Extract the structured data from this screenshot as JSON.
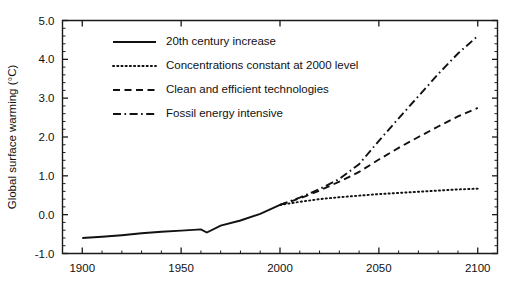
{
  "chart_data": {
    "type": "line",
    "title": "",
    "xlabel": "",
    "ylabel": "Global surface warming (°C)",
    "xlim": [
      1890,
      2110
    ],
    "ylim": [
      -1.0,
      5.0
    ],
    "grid": false,
    "legend_position": "upper-left-inside",
    "x_ticks": [
      1900,
      1950,
      2000,
      2050,
      2100
    ],
    "x_tick_labels": [
      "1900",
      "1950",
      "2000",
      "2050",
      "2100"
    ],
    "x_minor_step": 10,
    "y_ticks": [
      -1.0,
      0.0,
      1.0,
      2.0,
      3.0,
      4.0,
      5.0
    ],
    "y_tick_labels": [
      "-1.0",
      "0.0",
      "1.0",
      "2.0",
      "3.0",
      "4.0",
      "5.0"
    ],
    "y_minor_step": 0.2,
    "series": [
      {
        "name": "20th century increase",
        "style": "solid",
        "x": [
          1900,
          1910,
          1920,
          1930,
          1940,
          1950,
          1960,
          1963,
          1970,
          1980,
          1990,
          2000
        ],
        "y": [
          -0.6,
          -0.57,
          -0.53,
          -0.48,
          -0.44,
          -0.41,
          -0.38,
          -0.46,
          -0.28,
          -0.15,
          0.02,
          0.25
        ]
      },
      {
        "name": "Concentrations constant at 2000 level",
        "style": "dotted",
        "x": [
          2000,
          2010,
          2020,
          2030,
          2040,
          2050,
          2060,
          2070,
          2080,
          2090,
          2100
        ],
        "y": [
          0.25,
          0.33,
          0.4,
          0.45,
          0.49,
          0.53,
          0.56,
          0.59,
          0.62,
          0.65,
          0.67
        ]
      },
      {
        "name": "Clean and efficient technologies",
        "style": "dashed",
        "x": [
          2000,
          2010,
          2020,
          2030,
          2040,
          2050,
          2060,
          2070,
          2080,
          2090,
          2100
        ],
        "y": [
          0.25,
          0.42,
          0.62,
          0.85,
          1.1,
          1.42,
          1.72,
          2.0,
          2.27,
          2.53,
          2.75
        ]
      },
      {
        "name": "Fossil energy intensive",
        "style": "dashdot",
        "x": [
          2000,
          2010,
          2020,
          2030,
          2040,
          2050,
          2060,
          2070,
          2080,
          2090,
          2100
        ],
        "y": [
          0.25,
          0.44,
          0.66,
          0.92,
          1.3,
          1.9,
          2.48,
          3.05,
          3.62,
          4.15,
          4.6
        ]
      }
    ],
    "legend_entries": [
      {
        "label": "20th century increase",
        "style": "solid"
      },
      {
        "label": "Concentrations constant at 2000 level",
        "style": "dotted"
      },
      {
        "label": "Clean and efficient technologies",
        "style": "dashed"
      },
      {
        "label": "Fossil energy intensive",
        "style": "dashdot"
      }
    ],
    "colors": {
      "ink": "#111111",
      "background": "#ffffff"
    }
  }
}
